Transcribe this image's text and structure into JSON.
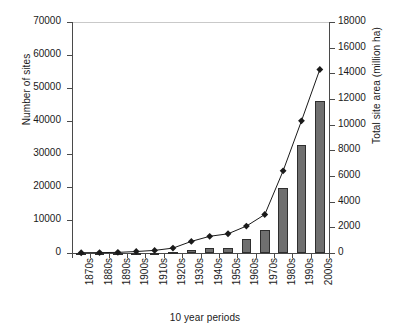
{
  "chart_data": {
    "type": "bar",
    "title": "",
    "xlabel": "10 year periods",
    "ylabel": "Number of sites",
    "y2label": "Total site area (million ha)",
    "grid": false,
    "legend": "none",
    "categories": [
      "1870s",
      "1880s",
      "1890s",
      "1900s",
      "1910s",
      "1920s",
      "1930s",
      "1940s",
      "1950s",
      "1960s",
      "1970s",
      "1980s",
      "1990s",
      "2000s"
    ],
    "ylim": [
      0,
      70000
    ],
    "yticks": [
      0,
      10000,
      20000,
      30000,
      40000,
      50000,
      60000,
      70000
    ],
    "y2lim": [
      0,
      18000
    ],
    "y2ticks": [
      0,
      2000,
      4000,
      6000,
      8000,
      10000,
      12000,
      14000,
      16000,
      18000
    ],
    "series": [
      {
        "name": "Number of sites",
        "axis": "left",
        "render": "bar",
        "values": [
          20,
          30,
          40,
          90,
          150,
          350,
          1000,
          1500,
          1600,
          4300,
          7000,
          19700,
          32600,
          46200
        ]
      },
      {
        "name": "Total site area (million ha)",
        "axis": "right",
        "render": "line",
        "marker": "diamond",
        "values": [
          20,
          30,
          50,
          120,
          200,
          380,
          900,
          1300,
          1500,
          2100,
          3000,
          6400,
          10300,
          14300
        ]
      }
    ],
    "bar_color": "#6f6f6f",
    "line_color": "#1a1a1a",
    "axis_color": "#4a4a4a"
  },
  "axis_titles": {
    "left": "Number of sites",
    "right": "Total site area (million ha)",
    "bottom": "10 year periods"
  }
}
